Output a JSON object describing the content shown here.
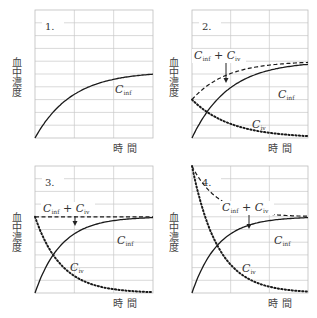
{
  "chart_data": [
    {
      "type": "line",
      "panel_label": "1.",
      "ylabel": "血中濃度",
      "xlabel": "時 間",
      "grid": true,
      "series": [
        {
          "name": "C_inf",
          "label_main": "C",
          "label_sub": "inf",
          "style": "solid",
          "description": "rises from 0 toward plateau",
          "start": 0.0,
          "plateau": 0.52,
          "rate": 3.2
        }
      ]
    },
    {
      "type": "line",
      "panel_label": "2.",
      "ylabel": "血中濃度",
      "xlabel": "時 間",
      "grid": true,
      "annotation": {
        "text_main1": "C",
        "text_sub1": "inf",
        "plus": " + ",
        "text_main2": "C",
        "text_sub2": "iv",
        "arrow": "down"
      },
      "series": [
        {
          "name": "C_inf",
          "label_main": "C",
          "label_sub": "inf",
          "style": "solid",
          "start": 0.0,
          "plateau": 0.6,
          "rate": 3.2
        },
        {
          "name": "C_iv",
          "label_main": "C",
          "label_sub": "iv",
          "style": "dotted",
          "start": 0.3,
          "plateau": 0.0,
          "rate": 3.0
        },
        {
          "name": "C_inf + C_iv",
          "style": "dashed",
          "sum": true
        }
      ]
    },
    {
      "type": "line",
      "panel_label": "3.",
      "ylabel": "血中濃度",
      "xlabel": "時 間",
      "grid": true,
      "annotation": {
        "text_main1": "C",
        "text_sub1": "inf",
        "plus": " + ",
        "text_main2": "C",
        "text_sub2": "iv",
        "arrow": "down"
      },
      "series": [
        {
          "name": "C_inf",
          "label_main": "C",
          "label_sub": "inf",
          "style": "solid",
          "start": 0.0,
          "plateau": 0.6,
          "rate": 4.5
        },
        {
          "name": "C_iv",
          "label_main": "C",
          "label_sub": "iv",
          "style": "dotted",
          "start": 0.6,
          "plateau": 0.0,
          "rate": 4.5
        },
        {
          "name": "C_inf + C_iv",
          "style": "dashed",
          "sum": true
        }
      ]
    },
    {
      "type": "line",
      "panel_label": "4.",
      "ylabel": "血中濃度",
      "xlabel": "時 間",
      "grid": true,
      "annotation": {
        "text_main1": "C",
        "text_sub1": "inf",
        "plus": " + ",
        "text_main2": "C",
        "text_sub2": "iv",
        "arrow": "down"
      },
      "series": [
        {
          "name": "C_inf",
          "label_main": "C",
          "label_sub": "inf",
          "style": "solid",
          "start": 0.0,
          "plateau": 0.6,
          "rate": 4.5
        },
        {
          "name": "C_iv",
          "label_main": "C",
          "label_sub": "iv",
          "style": "dotted",
          "start": 1.0,
          "plateau": 0.0,
          "rate": 4.5
        },
        {
          "name": "C_inf + C_iv",
          "style": "dashed",
          "sum": true
        }
      ]
    }
  ]
}
